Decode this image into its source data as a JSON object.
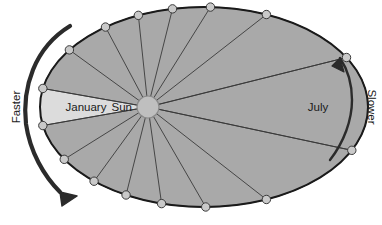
{
  "diagram": {
    "type": "kepler-second-law-orbit",
    "labels": {
      "sun": "Sun",
      "perihelion_month": "January",
      "aphelion_month": "July",
      "left_speed": "Faster",
      "right_speed": "Slower"
    },
    "colors": {
      "background": "#ffffff",
      "orbit_stroke": "#1a1a1a",
      "sector_light": "#dcdcdc",
      "sector_highlight": "#a9a9a9",
      "sector_divider": "#3a3a3a",
      "marker_fill": "#c9c9c9",
      "marker_stroke": "#3a3a3a",
      "sun_fill": "#bfbfbf",
      "sun_stroke": "#8a8a8a",
      "arrow_fill": "#2b2b2b",
      "text": "#1a1a1a"
    },
    "ellipse": {
      "center_x": 204,
      "center_y": 107,
      "radius_x": 164,
      "radius_y": 100
    },
    "sun": {
      "center_x": 148,
      "center_y": 107,
      "radius": 11
    },
    "sector_count": 12,
    "highlighted_sectors": [
      "January",
      "July"
    ],
    "sector_boundary_angles_deg": [
      170,
      144,
      118,
      96,
      76,
      58,
      38,
      14,
      348,
      322,
      300,
      278,
      256,
      234,
      212,
      190
    ],
    "marker_radius": 4.2,
    "arrows": {
      "faster": {
        "label": "Faster",
        "direction": "clockwise-down",
        "thickness": "thick",
        "side": "left"
      },
      "slower": {
        "label": "Slower",
        "direction": "counterclockwise-up",
        "thickness": "thin",
        "side": "right"
      }
    }
  }
}
